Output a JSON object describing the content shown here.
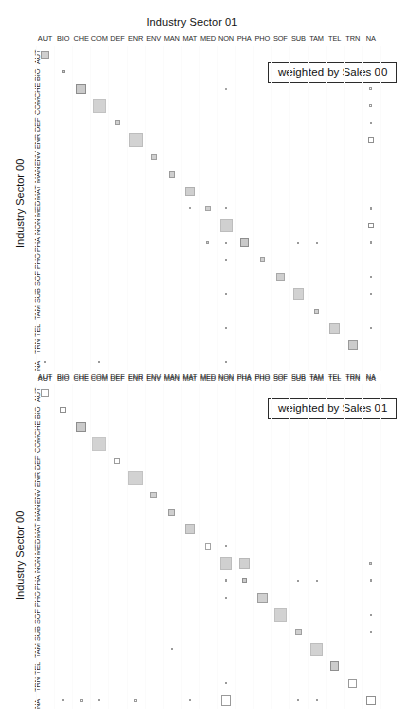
{
  "chart_data": {
    "type": "heatmap",
    "title": "Industry Sector 01",
    "xlabel": "Industry Sector 01",
    "ylabel": "Industry Sector 00",
    "grid": false,
    "legend_position": "top-right",
    "note": "Two square-size matrix (fourfold / Bertin) plots of industry sector transitions; marker area encodes magnitude, diagonal dominant.",
    "categories": [
      "AUT",
      "BIO",
      "CHE",
      "COM",
      "DEF",
      "ENR",
      "ENV",
      "MAN",
      "MAT",
      "MED",
      "NON",
      "PHA",
      "PHO",
      "SOF",
      "SUB",
      "TAM",
      "TEL",
      "TRN",
      "NA"
    ],
    "panels": [
      {
        "legend": "weighted by Sales 00",
        "xlabel": "Industry Sector 01",
        "ylabel": "Industry Sector 00",
        "cells": [
          {
            "r": 0,
            "c": 0,
            "v": 8.0,
            "fill": "#cfcfcf",
            "stroke": "#9a9a9a"
          },
          {
            "r": 1,
            "c": 1,
            "v": 3.0,
            "fill": "#cfcfcf",
            "stroke": "#8f8f8f"
          },
          {
            "r": 2,
            "c": 2,
            "v": 10.0,
            "fill": "#cacaca",
            "stroke": "#8d8d8d"
          },
          {
            "r": 3,
            "c": 3,
            "v": 13.5,
            "fill": "#d2d2d2",
            "stroke": "#c2c2c2"
          },
          {
            "r": 4,
            "c": 4,
            "v": 5.0,
            "fill": "#d0d0d0",
            "stroke": "#9c9c9c"
          },
          {
            "r": 5,
            "c": 5,
            "v": 14.0,
            "fill": "#d2d2d2",
            "stroke": "#bdbdbd"
          },
          {
            "r": 6,
            "c": 6,
            "v": 6.0,
            "fill": "#d0d0d0",
            "stroke": "#a0a0a0"
          },
          {
            "r": 7,
            "c": 7,
            "v": 6.5,
            "fill": "#cfcfcf",
            "stroke": "#9b9b9b"
          },
          {
            "r": 8,
            "c": 8,
            "v": 9.5,
            "fill": "#cfcfcf",
            "stroke": "#b0b0b0"
          },
          {
            "r": 9,
            "c": 9,
            "v": 5.5,
            "fill": "#d0d0d0",
            "stroke": "#a4a4a4"
          },
          {
            "r": 10,
            "c": 10,
            "v": 13.0,
            "fill": "#d0d0d0",
            "stroke": "#bdbdbd"
          },
          {
            "r": 11,
            "c": 11,
            "v": 9.0,
            "fill": "#cacaca",
            "stroke": "#8e8e8e"
          },
          {
            "r": 12,
            "c": 12,
            "v": 5.0,
            "fill": "#d0d0d0",
            "stroke": "#9e9e9e"
          },
          {
            "r": 13,
            "c": 13,
            "v": 8.5,
            "fill": "#cfcfcf",
            "stroke": "#a8a8a8"
          },
          {
            "r": 14,
            "c": 14,
            "v": 11.5,
            "fill": "#d2d2d2",
            "stroke": "#bcbcbc"
          },
          {
            "r": 15,
            "c": 15,
            "v": 5.0,
            "fill": "#cfcfcf",
            "stroke": "#9a9a9a"
          },
          {
            "r": 16,
            "c": 16,
            "v": 11.0,
            "fill": "#d0d0d0",
            "stroke": "#b4b4b4"
          },
          {
            "r": 17,
            "c": 17,
            "v": 10.0,
            "fill": "#cccccc",
            "stroke": "#9a9a9a"
          },
          {
            "r": 9,
            "c": 10,
            "v": 2.0,
            "fill": "#cfcfcf",
            "stroke": "#9b9b9b"
          },
          {
            "r": 2,
            "c": 10,
            "v": 1.6,
            "fill": "#c9c9c9",
            "stroke": "#a5a5a5"
          },
          {
            "r": 9,
            "c": 8,
            "v": 1.6,
            "fill": "#cfcfcf",
            "stroke": "#a0a0a0"
          },
          {
            "r": 11,
            "c": 10,
            "v": 2.0,
            "fill": "#cfcfcf",
            "stroke": "#9a9a9a"
          },
          {
            "r": 12,
            "c": 10,
            "v": 1.8,
            "fill": "#cfcfcf",
            "stroke": "#9a9a9a"
          },
          {
            "r": 14,
            "c": 10,
            "v": 1.8,
            "fill": "#cfcfcf",
            "stroke": "#9a9a9a"
          },
          {
            "r": 16,
            "c": 10,
            "v": 1.8,
            "fill": "#cfcfcf",
            "stroke": "#9a9a9a"
          },
          {
            "r": 11,
            "c": 14,
            "v": 1.8,
            "fill": "#cfcfcf",
            "stroke": "#9a9a9a"
          },
          {
            "r": 11,
            "c": 15,
            "v": 1.8,
            "fill": "#cfcfcf",
            "stroke": "#9a9a9a"
          },
          {
            "r": 11,
            "c": 9,
            "v": 3.0,
            "fill": "#cfcfcf",
            "stroke": "#9a9a9a"
          },
          {
            "r": 2,
            "c": 18,
            "v": 3.0,
            "fill": "#ffffff",
            "stroke": "#9a9a9a"
          },
          {
            "r": 3,
            "c": 18,
            "v": 3.2,
            "fill": "#ffffff",
            "stroke": "#9a9a9a"
          },
          {
            "r": 4,
            "c": 18,
            "v": 2.2,
            "fill": "#b8b8b8",
            "stroke": "#9a9a9a"
          },
          {
            "r": 5,
            "c": 18,
            "v": 5.5,
            "fill": "#ffffff",
            "stroke": "#8f8f8f"
          },
          {
            "r": 9,
            "c": 18,
            "v": 2.2,
            "fill": "#cfcfcf",
            "stroke": "#9a9a9a"
          },
          {
            "r": 10,
            "c": 18,
            "v": 5.5,
            "fill": "#ffffff",
            "stroke": "#8d8d8d"
          },
          {
            "r": 11,
            "c": 18,
            "v": 2.6,
            "fill": "#cfcfcf",
            "stroke": "#9a9a9a"
          },
          {
            "r": 13,
            "c": 18,
            "v": 2.6,
            "fill": "#cfcfcf",
            "stroke": "#9a9a9a"
          },
          {
            "r": 14,
            "c": 18,
            "v": 2.6,
            "fill": "#cfcfcf",
            "stroke": "#9a9a9a"
          },
          {
            "r": 16,
            "c": 18,
            "v": 2.6,
            "fill": "#cfcfcf",
            "stroke": "#9a9a9a"
          },
          {
            "r": 18,
            "c": 0,
            "v": 1.8,
            "fill": "#cfcfcf",
            "stroke": "#9a9a9a"
          },
          {
            "r": 18,
            "c": 3,
            "v": 1.8,
            "fill": "#cfcfcf",
            "stroke": "#9a9a9a"
          },
          {
            "r": 18,
            "c": 10,
            "v": 2.0,
            "fill": "#cfcfcf",
            "stroke": "#9a9a9a"
          }
        ]
      },
      {
        "legend": "weighted by Sales 01",
        "xlabel": "Industry Sector 01",
        "ylabel": "Industry Sector 00",
        "cells": [
          {
            "r": 0,
            "c": 0,
            "v": 8.0,
            "fill": "#ffffff",
            "stroke": "#9a9a9a"
          },
          {
            "r": 1,
            "c": 1,
            "v": 6.0,
            "fill": "#ffffff",
            "stroke": "#8f8f8f"
          },
          {
            "r": 2,
            "c": 2,
            "v": 10.0,
            "fill": "#cacaca",
            "stroke": "#8d8d8d"
          },
          {
            "r": 3,
            "c": 3,
            "v": 14.0,
            "fill": "#d2d2d2",
            "stroke": "#c6c6c6"
          },
          {
            "r": 4,
            "c": 4,
            "v": 6.0,
            "fill": "#ffffff",
            "stroke": "#9c9c9c"
          },
          {
            "r": 5,
            "c": 5,
            "v": 14.5,
            "fill": "#d2d2d2",
            "stroke": "#c3c3c3"
          },
          {
            "r": 6,
            "c": 6,
            "v": 6.5,
            "fill": "#d0d0d0",
            "stroke": "#a0a0a0"
          },
          {
            "r": 7,
            "c": 7,
            "v": 7.0,
            "fill": "#cfcfcf",
            "stroke": "#9b9b9b"
          },
          {
            "r": 8,
            "c": 8,
            "v": 10.0,
            "fill": "#cfcfcf",
            "stroke": "#b0b0b0"
          },
          {
            "r": 9,
            "c": 9,
            "v": 6.5,
            "fill": "#ffffff",
            "stroke": "#a4a4a4"
          },
          {
            "r": 10,
            "c": 10,
            "v": 12.5,
            "fill": "#d0d0d0",
            "stroke": "#bdbdbd"
          },
          {
            "r": 11,
            "c": 11,
            "v": 5.0,
            "fill": "#cacaca",
            "stroke": "#8e8e8e"
          },
          {
            "r": 12,
            "c": 12,
            "v": 10.5,
            "fill": "#d0d0d0",
            "stroke": "#9e9e9e"
          },
          {
            "r": 13,
            "c": 13,
            "v": 13.5,
            "fill": "#d2d2d2",
            "stroke": "#c0c0c0"
          },
          {
            "r": 14,
            "c": 14,
            "v": 6.5,
            "fill": "#cfcfcf",
            "stroke": "#a0a0a0"
          },
          {
            "r": 15,
            "c": 15,
            "v": 13.0,
            "fill": "#d2d2d2",
            "stroke": "#bebebe"
          },
          {
            "r": 16,
            "c": 16,
            "v": 9.5,
            "fill": "#cccccc",
            "stroke": "#8f8f8f"
          },
          {
            "r": 17,
            "c": 17,
            "v": 9.0,
            "fill": "#ffffff",
            "stroke": "#9a9a9a"
          },
          {
            "r": 18,
            "c": 18,
            "v": 9.5,
            "fill": "#ffffff",
            "stroke": "#8f8f8f"
          },
          {
            "r": 9,
            "c": 10,
            "v": 2.0,
            "fill": "#cfcfcf",
            "stroke": "#9b9b9b"
          },
          {
            "r": 10,
            "c": 11,
            "v": 11.0,
            "fill": "#d0d0d0",
            "stroke": "#b8b8b8"
          },
          {
            "r": 11,
            "c": 10,
            "v": 2.6,
            "fill": "#cfcfcf",
            "stroke": "#9a9a9a"
          },
          {
            "r": 11,
            "c": 14,
            "v": 1.8,
            "fill": "#cfcfcf",
            "stroke": "#9a9a9a"
          },
          {
            "r": 11,
            "c": 15,
            "v": 1.8,
            "fill": "#cfcfcf",
            "stroke": "#9a9a9a"
          },
          {
            "r": 10,
            "c": 18,
            "v": 3.0,
            "fill": "#cfcfcf",
            "stroke": "#9a9a9a"
          },
          {
            "r": 11,
            "c": 18,
            "v": 2.6,
            "fill": "#cfcfcf",
            "stroke": "#9a9a9a"
          },
          {
            "r": 13,
            "c": 18,
            "v": 2.4,
            "fill": "#cfcfcf",
            "stroke": "#9a9a9a"
          },
          {
            "r": 14,
            "c": 18,
            "v": 2.4,
            "fill": "#cfcfcf",
            "stroke": "#9a9a9a"
          },
          {
            "r": 12,
            "c": 10,
            "v": 1.8,
            "fill": "#cfcfcf",
            "stroke": "#9a9a9a"
          },
          {
            "r": 15,
            "c": 7,
            "v": 2.0,
            "fill": "#cfcfcf",
            "stroke": "#9a9a9a"
          },
          {
            "r": 17,
            "c": 10,
            "v": 2.0,
            "fill": "#cfcfcf",
            "stroke": "#9a9a9a"
          },
          {
            "r": 18,
            "c": 1,
            "v": 1.8,
            "fill": "#cfcfcf",
            "stroke": "#9a9a9a"
          },
          {
            "r": 18,
            "c": 2,
            "v": 3.4,
            "fill": "#ffffff",
            "stroke": "#9a9a9a"
          },
          {
            "r": 18,
            "c": 3,
            "v": 1.8,
            "fill": "#cfcfcf",
            "stroke": "#9a9a9a"
          },
          {
            "r": 18,
            "c": 5,
            "v": 3.6,
            "fill": "#ffffff",
            "stroke": "#9a9a9a"
          },
          {
            "r": 18,
            "c": 8,
            "v": 1.8,
            "fill": "#cfcfcf",
            "stroke": "#9a9a9a"
          },
          {
            "r": 18,
            "c": 10,
            "v": 10.5,
            "fill": "#ffffff",
            "stroke": "#9a9a9a"
          },
          {
            "r": 18,
            "c": 14,
            "v": 1.8,
            "fill": "#cfcfcf",
            "stroke": "#9a9a9a"
          },
          {
            "r": 18,
            "c": 15,
            "v": 1.8,
            "fill": "#cfcfcf",
            "stroke": "#9a9a9a"
          }
        ]
      }
    ]
  },
  "layout": {
    "plot_left": 36,
    "plot_width": 344,
    "cell_pitch_x": 18.1,
    "cell_pitch_y": 17.1,
    "panel_plot_tops": [
      46,
      384
    ],
    "panel_rows": 19,
    "panel_cols": 19,
    "max_marker": 16,
    "value_to_px": 1.0
  }
}
